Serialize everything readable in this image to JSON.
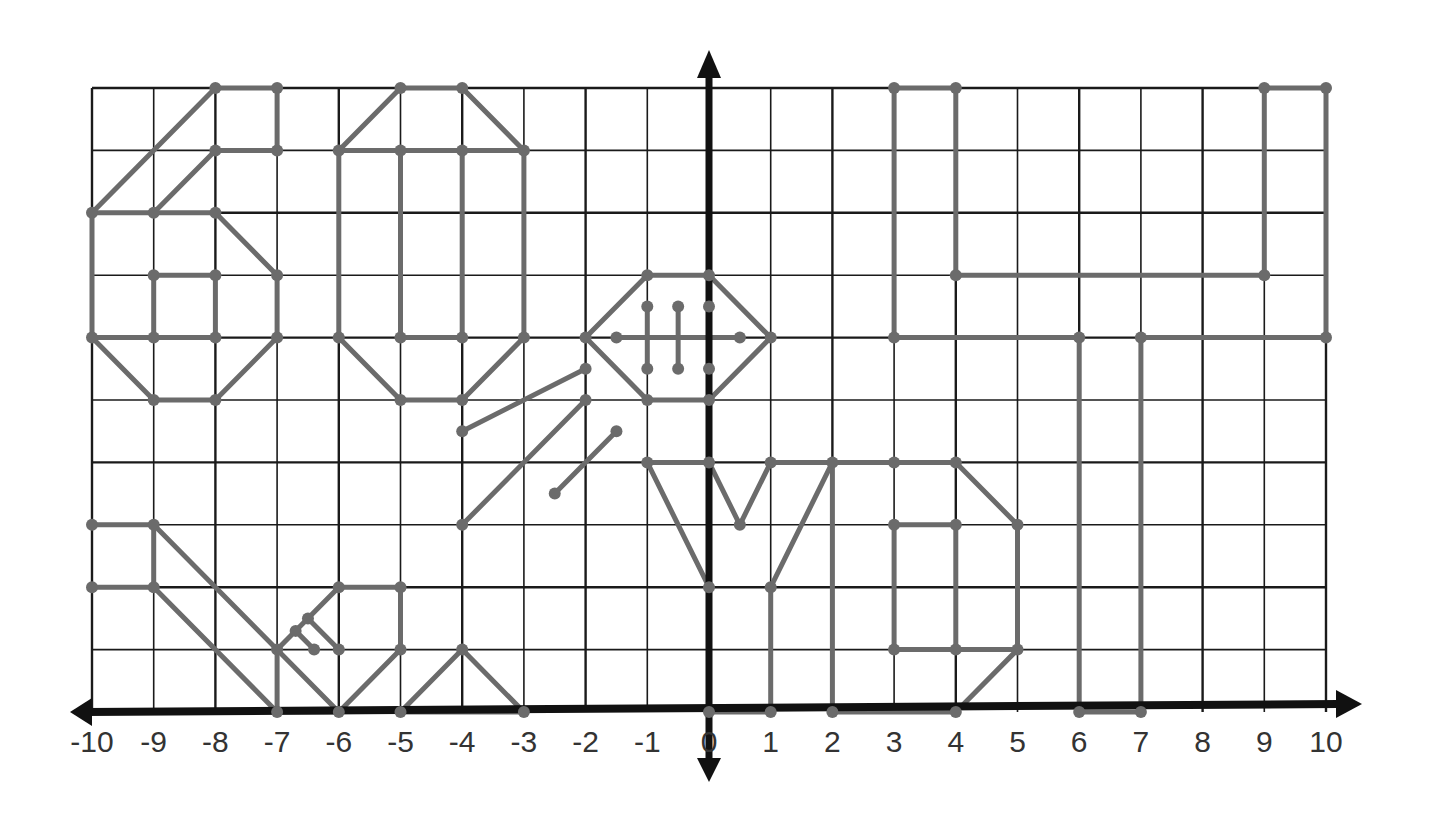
{
  "colors": {
    "grid": "#1a1a1a",
    "axis": "#111111",
    "segment": "#6b6b6b",
    "point": "#6b6b6b",
    "label": "#333333"
  },
  "chart_data": {
    "type": "line",
    "xlim": [
      -10,
      10
    ],
    "ylim": [
      0,
      10
    ],
    "grid": true,
    "x_ticks": [
      -10,
      -9,
      -8,
      -7,
      -6,
      -5,
      -4,
      -3,
      -2,
      -1,
      0,
      1,
      2,
      3,
      4,
      5,
      6,
      7,
      8,
      9,
      10
    ],
    "x_tick_labels": [
      "-10",
      "-9",
      "-8",
      "-7",
      "-6",
      "-5",
      "-4",
      "-3",
      "-2",
      "-1",
      "0",
      "1",
      "2",
      "3",
      "4",
      "5",
      "6",
      "7",
      "8",
      "9",
      "10"
    ],
    "segments": [
      [
        [
          -10,
          8
        ],
        [
          -8,
          10
        ]
      ],
      [
        [
          -8,
          10
        ],
        [
          -7,
          10
        ]
      ],
      [
        [
          -7,
          10
        ],
        [
          -7,
          9
        ]
      ],
      [
        [
          -9,
          8
        ],
        [
          -8,
          9
        ]
      ],
      [
        [
          -8,
          9
        ],
        [
          -7,
          9
        ]
      ],
      [
        [
          -10,
          8
        ],
        [
          -10,
          6
        ]
      ],
      [
        [
          -10,
          6
        ],
        [
          -9,
          5
        ]
      ],
      [
        [
          -9,
          5
        ],
        [
          -8,
          5
        ]
      ],
      [
        [
          -8,
          5
        ],
        [
          -7,
          6
        ]
      ],
      [
        [
          -7,
          6
        ],
        [
          -7,
          7
        ]
      ],
      [
        [
          -7,
          7
        ],
        [
          -8,
          8
        ]
      ],
      [
        [
          -8,
          8
        ],
        [
          -9,
          8
        ]
      ],
      [
        [
          -10,
          8
        ],
        [
          -9,
          8
        ]
      ],
      [
        [
          -9,
          7
        ],
        [
          -8,
          7
        ]
      ],
      [
        [
          -9,
          7
        ],
        [
          -9,
          6
        ]
      ],
      [
        [
          -8,
          7
        ],
        [
          -8,
          6
        ]
      ],
      [
        [
          -9,
          6
        ],
        [
          -8,
          6
        ]
      ],
      [
        [
          -10,
          6
        ],
        [
          -9,
          6
        ]
      ],
      [
        [
          -6,
          9
        ],
        [
          -5,
          10
        ]
      ],
      [
        [
          -5,
          10
        ],
        [
          -4,
          10
        ]
      ],
      [
        [
          -4,
          10
        ],
        [
          -3,
          9
        ]
      ],
      [
        [
          -6,
          9
        ],
        [
          -6,
          6
        ]
      ],
      [
        [
          -6,
          6
        ],
        [
          -5,
          5
        ]
      ],
      [
        [
          -5,
          5
        ],
        [
          -4,
          5
        ]
      ],
      [
        [
          -4,
          5
        ],
        [
          -3,
          6
        ]
      ],
      [
        [
          -3,
          6
        ],
        [
          -3,
          9
        ]
      ],
      [
        [
          -5,
          9
        ],
        [
          -4,
          9
        ]
      ],
      [
        [
          -5,
          9
        ],
        [
          -5,
          6
        ]
      ],
      [
        [
          -4,
          9
        ],
        [
          -4,
          6
        ]
      ],
      [
        [
          -5,
          6
        ],
        [
          -4,
          6
        ]
      ],
      [
        [
          -6,
          9
        ],
        [
          -5,
          9
        ]
      ],
      [
        [
          -4,
          9
        ],
        [
          -3,
          9
        ]
      ],
      [
        [
          -1,
          7
        ],
        [
          0,
          7
        ]
      ],
      [
        [
          0,
          7
        ],
        [
          1,
          6
        ]
      ],
      [
        [
          1,
          6
        ],
        [
          0,
          5
        ]
      ],
      [
        [
          0,
          5
        ],
        [
          -1,
          5
        ]
      ],
      [
        [
          -1,
          5
        ],
        [
          -2,
          6
        ]
      ],
      [
        [
          -2,
          6
        ],
        [
          -1,
          7
        ]
      ],
      [
        [
          -1.5,
          6
        ],
        [
          0.5,
          6
        ]
      ],
      [
        [
          -1,
          6.5
        ],
        [
          -1,
          5.5
        ]
      ],
      [
        [
          -0.5,
          6.5
        ],
        [
          -0.5,
          5.5
        ]
      ],
      [
        [
          0,
          6.5
        ],
        [
          0,
          5.5
        ]
      ],
      [
        [
          -4,
          4.5
        ],
        [
          -2,
          5.5
        ]
      ],
      [
        [
          -4,
          3
        ],
        [
          -2,
          5
        ]
      ],
      [
        [
          -2.5,
          3.5
        ],
        [
          -1.5,
          4.5
        ]
      ],
      [
        [
          -10,
          3
        ],
        [
          -9,
          3
        ]
      ],
      [
        [
          -9,
          3
        ],
        [
          -9,
          2
        ]
      ],
      [
        [
          -10,
          2
        ],
        [
          -9,
          2
        ]
      ],
      [
        [
          -9,
          3
        ],
        [
          -6,
          0
        ]
      ],
      [
        [
          -9,
          2
        ],
        [
          -7,
          0
        ]
      ],
      [
        [
          -7,
          0
        ],
        [
          -6,
          0
        ]
      ],
      [
        [
          -7,
          1
        ],
        [
          -7,
          0
        ]
      ],
      [
        [
          -7,
          1
        ],
        [
          -6,
          2
        ]
      ],
      [
        [
          -6,
          2
        ],
        [
          -5,
          2
        ]
      ],
      [
        [
          -5,
          2
        ],
        [
          -5,
          1
        ]
      ],
      [
        [
          -6.7,
          1.3
        ],
        [
          -6.4,
          1
        ]
      ],
      [
        [
          -6.5,
          1.5
        ],
        [
          -6,
          1
        ]
      ],
      [
        [
          -6,
          0
        ],
        [
          -5,
          1
        ]
      ],
      [
        [
          -5,
          0
        ],
        [
          -4,
          1
        ]
      ],
      [
        [
          -4,
          1
        ],
        [
          -3,
          0
        ]
      ],
      [
        [
          -5,
          0
        ],
        [
          -3,
          0
        ]
      ],
      [
        [
          -1,
          4
        ],
        [
          0,
          2
        ]
      ],
      [
        [
          -1,
          4
        ],
        [
          0,
          4
        ]
      ],
      [
        [
          0,
          4
        ],
        [
          0.5,
          3
        ]
      ],
      [
        [
          0.5,
          3
        ],
        [
          1,
          4
        ]
      ],
      [
        [
          1,
          4
        ],
        [
          3,
          4
        ]
      ],
      [
        [
          2,
          4
        ],
        [
          1,
          2
        ]
      ],
      [
        [
          1,
          2
        ],
        [
          1,
          0
        ]
      ],
      [
        [
          0,
          2
        ],
        [
          0,
          0
        ]
      ],
      [
        [
          0,
          0
        ],
        [
          1,
          0
        ]
      ],
      [
        [
          2,
          4
        ],
        [
          2,
          0
        ]
      ],
      [
        [
          2,
          0
        ],
        [
          4,
          0
        ]
      ],
      [
        [
          3,
          4
        ],
        [
          4,
          4
        ]
      ],
      [
        [
          4,
          4
        ],
        [
          5,
          3
        ]
      ],
      [
        [
          5,
          3
        ],
        [
          5,
          1
        ]
      ],
      [
        [
          5,
          1
        ],
        [
          4,
          0
        ]
      ],
      [
        [
          3,
          3
        ],
        [
          4,
          3
        ]
      ],
      [
        [
          3,
          3
        ],
        [
          3,
          1
        ]
      ],
      [
        [
          4,
          3
        ],
        [
          4,
          1
        ]
      ],
      [
        [
          3,
          1
        ],
        [
          4,
          1
        ]
      ],
      [
        [
          4,
          1
        ],
        [
          5,
          1
        ]
      ],
      [
        [
          3,
          10
        ],
        [
          4,
          10
        ]
      ],
      [
        [
          3,
          10
        ],
        [
          3,
          6
        ]
      ],
      [
        [
          4,
          10
        ],
        [
          4,
          7
        ]
      ],
      [
        [
          4,
          7
        ],
        [
          9,
          7
        ]
      ],
      [
        [
          9,
          10
        ],
        [
          10,
          10
        ]
      ],
      [
        [
          9,
          10
        ],
        [
          9,
          7
        ]
      ],
      [
        [
          10,
          10
        ],
        [
          10,
          6
        ]
      ],
      [
        [
          3,
          6
        ],
        [
          6,
          6
        ]
      ],
      [
        [
          6,
          6
        ],
        [
          6,
          0
        ]
      ],
      [
        [
          7,
          6
        ],
        [
          10,
          6
        ]
      ],
      [
        [
          7,
          6
        ],
        [
          7,
          0
        ]
      ],
      [
        [
          6,
          0
        ],
        [
          7,
          0
        ]
      ]
    ],
    "points": [
      [
        -10,
        8
      ],
      [
        -8,
        10
      ],
      [
        -7,
        10
      ],
      [
        -7,
        9
      ],
      [
        -8,
        9
      ],
      [
        -9,
        8
      ],
      [
        -8,
        8
      ],
      [
        -10,
        6
      ],
      [
        -9,
        5
      ],
      [
        -8,
        5
      ],
      [
        -7,
        6
      ],
      [
        -7,
        7
      ],
      [
        -9,
        7
      ],
      [
        -8,
        7
      ],
      [
        -9,
        6
      ],
      [
        -8,
        6
      ],
      [
        -6,
        9
      ],
      [
        -5,
        10
      ],
      [
        -4,
        10
      ],
      [
        -3,
        9
      ],
      [
        -5,
        9
      ],
      [
        -4,
        9
      ],
      [
        -6,
        6
      ],
      [
        -5,
        5
      ],
      [
        -4,
        5
      ],
      [
        -3,
        6
      ],
      [
        -5,
        6
      ],
      [
        -4,
        6
      ],
      [
        -1,
        7
      ],
      [
        0,
        7
      ],
      [
        1,
        6
      ],
      [
        0,
        5
      ],
      [
        -1,
        5
      ],
      [
        -2,
        6
      ],
      [
        -1.5,
        6
      ],
      [
        0.5,
        6
      ],
      [
        -1,
        6.5
      ],
      [
        -1,
        5.5
      ],
      [
        -0.5,
        6.5
      ],
      [
        -0.5,
        5.5
      ],
      [
        0,
        6.5
      ],
      [
        0,
        5.5
      ],
      [
        -4,
        4.5
      ],
      [
        -2,
        5.5
      ],
      [
        -4,
        3
      ],
      [
        -2,
        5
      ],
      [
        -2.5,
        3.5
      ],
      [
        -1.5,
        4.5
      ],
      [
        -10,
        3
      ],
      [
        -9,
        3
      ],
      [
        -10,
        2
      ],
      [
        -9,
        2
      ],
      [
        -7,
        0
      ],
      [
        -6,
        0
      ],
      [
        -5,
        0
      ],
      [
        -3,
        0
      ],
      [
        -4,
        1
      ],
      [
        -7,
        1
      ],
      [
        -6,
        2
      ],
      [
        -5,
        2
      ],
      [
        -5,
        1
      ],
      [
        -6,
        1
      ],
      [
        -6.7,
        1.3
      ],
      [
        -6.5,
        1.5
      ],
      [
        -6.4,
        1
      ],
      [
        -1,
        4
      ],
      [
        0,
        4
      ],
      [
        0.5,
        3
      ],
      [
        1,
        4
      ],
      [
        2,
        4
      ],
      [
        0,
        2
      ],
      [
        1,
        2
      ],
      [
        0,
        0
      ],
      [
        1,
        0
      ],
      [
        2,
        0
      ],
      [
        4,
        0
      ],
      [
        3,
        4
      ],
      [
        4,
        4
      ],
      [
        5,
        3
      ],
      [
        5,
        1
      ],
      [
        3,
        3
      ],
      [
        4,
        3
      ],
      [
        3,
        1
      ],
      [
        4,
        1
      ],
      [
        3,
        10
      ],
      [
        4,
        10
      ],
      [
        4,
        7
      ],
      [
        9,
        7
      ],
      [
        9,
        10
      ],
      [
        10,
        10
      ],
      [
        10,
        6
      ],
      [
        3,
        6
      ],
      [
        6,
        6
      ],
      [
        7,
        6
      ],
      [
        6,
        0
      ],
      [
        7,
        0
      ]
    ]
  }
}
